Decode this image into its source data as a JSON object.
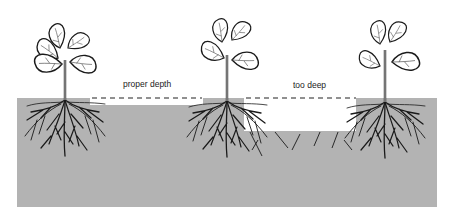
{
  "diagram": {
    "labels": {
      "proper": "proper depth",
      "too_deep": "too deep"
    },
    "plants": [
      {
        "id": "left",
        "description": "seedling with roots at soil surface"
      },
      {
        "id": "middle",
        "description": "seedling planted at proper depth"
      },
      {
        "id": "right",
        "description": "seedling with roots at soil surface"
      }
    ],
    "colors": {
      "soil": "#b3b3b3",
      "outline": "#1a1a1a",
      "background": "#ffffff"
    }
  }
}
